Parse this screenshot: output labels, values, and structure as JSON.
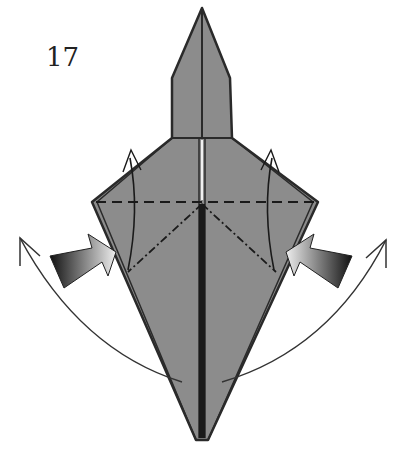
{
  "diagram": {
    "step_number": "17",
    "colors": {
      "paper": "#8c8c8c",
      "outline": "#2a2a2a",
      "push_arrow_dark": "#111111",
      "push_arrow_light": "#e6e6e6",
      "motion_arrow": "#333333"
    },
    "annotations": [
      {
        "type": "valley-fold-line",
        "description": "horizontal dashed line across wings"
      },
      {
        "type": "mountain-fold-line",
        "description": "dash-dot lines from center to lower sides"
      },
      {
        "type": "push-arrow",
        "side": "left"
      },
      {
        "type": "push-arrow",
        "side": "right"
      },
      {
        "type": "swing-arrow",
        "side": "left"
      },
      {
        "type": "swing-arrow",
        "side": "right"
      }
    ]
  }
}
